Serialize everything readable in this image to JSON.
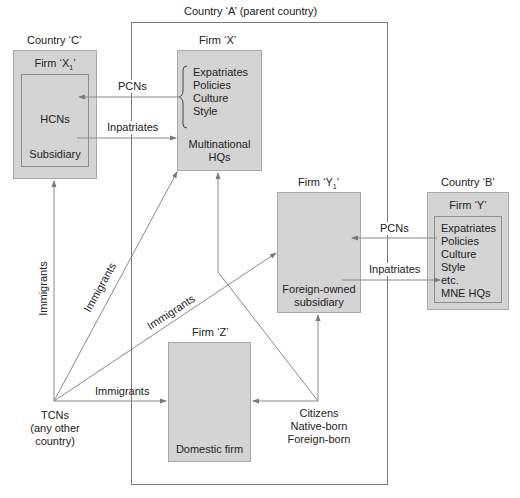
{
  "diagram": {
    "type": "flow",
    "colors": {
      "box_fill": "#d4d4d4",
      "box_border": "#a8a8a8",
      "line": "#8a8a8a",
      "text": "#222222"
    },
    "country_a": {
      "label": "Country ‘A’ (parent country)"
    },
    "country_c": {
      "label": "Country ‘C’",
      "firm_label": "Firm ‘X",
      "firm_subscript": "1",
      "firm_label_end": "’",
      "hcns": "HCNs",
      "subsidiary": "Subsidiary"
    },
    "firm_x": {
      "label": "Firm ‘X’",
      "items": [
        "Expatriates",
        "Policies",
        "Culture",
        "Style"
      ],
      "hq_line1": "Multinational",
      "hq_line2": "HQs"
    },
    "firm_y1": {
      "label": "Firm ‘Y",
      "subscript": "1",
      "label_end": "’",
      "desc_line1": "Foreign-owned",
      "desc_line2": "subsidiary"
    },
    "country_b": {
      "label": "Country ‘B’",
      "firm_label": "Firm ‘Y’",
      "items": [
        "Expatriates",
        "Policies",
        "Culture",
        "Style",
        "etc.",
        "MNE HQs"
      ]
    },
    "firm_z": {
      "label": "Firm ‘Z’",
      "desc": "Domestic firm"
    },
    "tcns": {
      "line1": "TCNs",
      "line2": "(any other",
      "line3": "country)"
    },
    "citizens": {
      "line1": "Citizens",
      "line2": "Native-born",
      "line3": "Foreign-born"
    },
    "flows": {
      "pcns_c": "PCNs",
      "inpatriates_c": "Inpatriates",
      "pcns_b": "PCNs",
      "inpatriates_b": "Inpatriates",
      "immigrants_vertical": "Immigrants",
      "immigrants_to_x": "Immigrants",
      "immigrants_to_y1": "Immigrants",
      "immigrants_to_z": "Immigrants"
    }
  }
}
